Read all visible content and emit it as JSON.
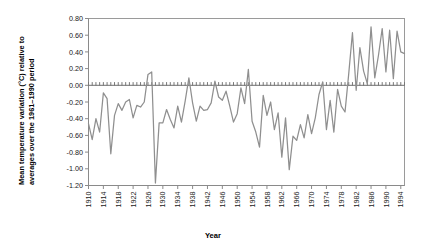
{
  "chart_data": {
    "type": "line",
    "title": "",
    "xlabel": "Year",
    "ylabel": "Mean temperature variation (°C) relative to averages over the 1961–1990 period",
    "ylabel_line1": "Mean temperature variation (°C) relative to",
    "ylabel_line2": "averages over the 1961–1990 period",
    "ylim": [
      -1.2,
      0.8
    ],
    "xlim": [
      1910,
      1995
    ],
    "ytick_labels": [
      "0.80",
      "0.60",
      "0.40",
      "0.20",
      "0.00",
      "-0.20",
      "-0.40",
      "-0.60",
      "-0.80",
      "-1.00",
      "-1.20"
    ],
    "ytick_values": [
      0.8,
      0.6,
      0.4,
      0.2,
      0.0,
      -0.2,
      -0.4,
      -0.6,
      -0.8,
      -1.0,
      -1.2
    ],
    "xtick_labels": [
      "1910",
      "1914",
      "1918",
      "1922",
      "1926",
      "1930",
      "1934",
      "1938",
      "1942",
      "1946",
      "1950",
      "1954",
      "1958",
      "1962",
      "1966",
      "1970",
      "1974",
      "1978",
      "1982",
      "1986",
      "1990",
      "1994"
    ],
    "xtick_values": [
      1910,
      1914,
      1918,
      1922,
      1926,
      1930,
      1934,
      1938,
      1942,
      1946,
      1950,
      1954,
      1958,
      1962,
      1966,
      1970,
      1974,
      1978,
      1982,
      1986,
      1990,
      1994
    ],
    "grid": false,
    "legend": false,
    "line_color": "#8f8f8f",
    "zero_reference_line": 0.0,
    "x": [
      1910,
      1911,
      1912,
      1913,
      1914,
      1915,
      1916,
      1917,
      1918,
      1919,
      1920,
      1921,
      1922,
      1923,
      1924,
      1925,
      1926,
      1927,
      1928,
      1929,
      1930,
      1931,
      1932,
      1933,
      1934,
      1935,
      1936,
      1937,
      1938,
      1939,
      1940,
      1941,
      1942,
      1943,
      1944,
      1945,
      1946,
      1947,
      1948,
      1949,
      1950,
      1951,
      1952,
      1953,
      1954,
      1955,
      1956,
      1957,
      1958,
      1959,
      1960,
      1961,
      1962,
      1963,
      1964,
      1965,
      1966,
      1967,
      1968,
      1969,
      1970,
      1971,
      1972,
      1973,
      1974,
      1975,
      1976,
      1977,
      1978,
      1979,
      1980,
      1981,
      1982,
      1983,
      1984,
      1985,
      1986,
      1987,
      1988,
      1989,
      1990,
      1991,
      1992,
      1993,
      1994,
      1995
    ],
    "values": [
      -0.46,
      -0.65,
      -0.4,
      -0.56,
      -0.09,
      -0.16,
      -0.82,
      -0.36,
      -0.22,
      -0.3,
      -0.2,
      -0.17,
      -0.39,
      -0.24,
      -0.26,
      -0.2,
      0.13,
      0.16,
      -1.17,
      -0.45,
      -0.45,
      -0.29,
      -0.41,
      -0.51,
      -0.25,
      -0.44,
      -0.19,
      0.09,
      -0.21,
      -0.43,
      -0.25,
      -0.3,
      -0.29,
      -0.21,
      0.05,
      -0.14,
      -0.18,
      -0.07,
      -0.25,
      -0.44,
      -0.34,
      -0.03,
      -0.22,
      0.19,
      -0.43,
      -0.56,
      -0.74,
      -0.12,
      -0.36,
      -0.2,
      -0.53,
      -0.33,
      -0.86,
      -0.39,
      -1.01,
      -0.61,
      -0.66,
      -0.47,
      -0.63,
      -0.35,
      -0.58,
      -0.39,
      -0.11,
      0.04,
      -0.53,
      -0.18,
      -0.56,
      -0.05,
      -0.25,
      -0.32,
      0.14,
      0.63,
      -0.06,
      0.45,
      0.17,
      0.02,
      0.7,
      0.09,
      0.36,
      0.68,
      0.16,
      0.66,
      0.08,
      0.65,
      0.4,
      0.38
    ]
  }
}
